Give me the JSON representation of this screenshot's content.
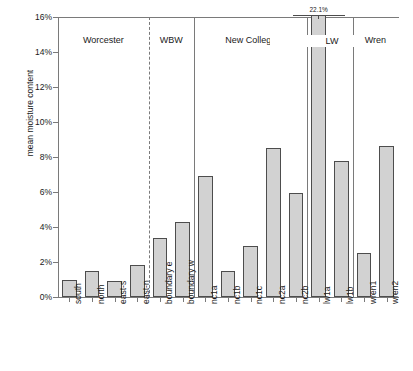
{
  "chart_data": {
    "type": "bar",
    "title": "",
    "xlabel": "",
    "ylabel": "mean moisture content",
    "ylim": [
      0,
      16
    ],
    "ytick_labels": [
      "0%",
      "2%",
      "4%",
      "6%",
      "8%",
      "10%",
      "12%",
      "14%",
      "16%"
    ],
    "ytick_values": [
      0,
      2,
      4,
      6,
      8,
      10,
      12,
      14,
      16
    ],
    "grid": false,
    "legend": "none",
    "categories": [
      "south",
      "north",
      "east-s",
      "east-n",
      "boundary e",
      "boundary w",
      "nc1a",
      "nc1b",
      "nc1c",
      "nc2a",
      "nc2b",
      "lw1a",
      "lw1b",
      "wren1",
      "wren2"
    ],
    "values": [
      1.0,
      1.5,
      0.9,
      1.85,
      3.4,
      4.3,
      6.9,
      1.5,
      2.9,
      8.5,
      5.95,
      22.1,
      7.75,
      2.5,
      8.65
    ],
    "annotations": [
      {
        "text": "22.1%",
        "category": "lw1a",
        "note": "bar exceeds axis maximum and is clipped"
      }
    ],
    "groups": [
      {
        "label": "Worcester",
        "categories": [
          "south",
          "north",
          "east-s",
          "east-n"
        ],
        "separator": "dashed"
      },
      {
        "label": "WBW",
        "categories": [
          "boundary e",
          "boundary w"
        ],
        "separator": "solid"
      },
      {
        "label": "New College",
        "categories": [
          "nc1a",
          "nc1b",
          "nc1c",
          "nc2a",
          "nc2b"
        ],
        "separator": "solid"
      },
      {
        "label": "LW",
        "categories": [
          "lw1a",
          "lw1b"
        ],
        "separator": "solid"
      },
      {
        "label": "Wren",
        "categories": [
          "wren1",
          "wren2"
        ],
        "separator": "solid"
      }
    ],
    "bar_color": "#d2d2d2",
    "bar_edge_color": "#4d4d4d",
    "axis_color": "#7a7a7a"
  }
}
